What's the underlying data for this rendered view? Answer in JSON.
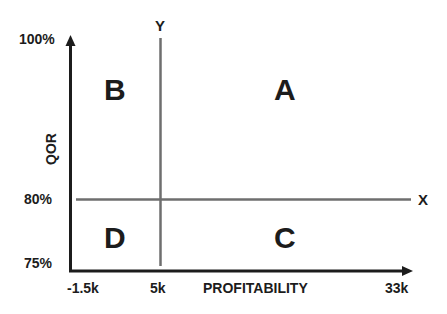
{
  "diagram": {
    "type": "quadrant-matrix",
    "x_axis": {
      "title": "PROFITABILITY",
      "ticks": [
        "-1.5k",
        "5k",
        "33k"
      ],
      "divider_label": "X"
    },
    "y_axis": {
      "title": "QOR",
      "ticks": [
        "100%",
        "80%",
        "75%"
      ],
      "divider_label": "Y"
    },
    "quadrants": {
      "top_left": "B",
      "top_right": "A",
      "bottom_left": "D",
      "bottom_right": "C"
    },
    "colors": {
      "axis": "#1c1c1c",
      "divider": "#6e6e6e",
      "background": "#ffffff"
    }
  }
}
